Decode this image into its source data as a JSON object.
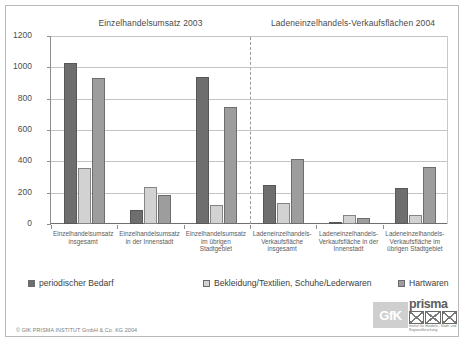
{
  "chart_data": {
    "type": "bar",
    "title": "",
    "panels": [
      {
        "name": "Einzelhandelsumsatz 2003"
      },
      {
        "name": "Ladeneinzelhandels-Verkaufsflächen 2004"
      }
    ],
    "categories": [
      "Einzelhandelsumsatz insgesamt",
      "Einzelhandelsumsatz in der Innenstadt",
      "Einzelhandelsumsatz im übrigen Stadtgebiet",
      "Ladeneinzelhandels-Verkaufsfläche insgesamt",
      "Ladeneinzelhandels-Verkaufsfläche in der Innenstadt",
      "Ladeneinzelhandels-Verkaufsfläche im übrigen Stadtgebiet"
    ],
    "series": [
      {
        "name": "periodischer Bedarf",
        "color": "#6e6e6e",
        "values": [
          1030,
          90,
          940,
          250,
          10,
          230
        ]
      },
      {
        "name": "Bekleidung/Textilien, Schuhe/Lederwaren",
        "color": "#d2d2d2",
        "values": [
          360,
          235,
          120,
          135,
          60,
          55
        ]
      },
      {
        "name": "Hartwaren",
        "color": "#9d9d9d",
        "values": [
          935,
          185,
          745,
          415,
          40,
          365
        ]
      }
    ],
    "ylim": [
      0,
      1200
    ],
    "yticks": [
      0,
      200,
      400,
      600,
      800,
      1000,
      1200
    ],
    "xlabel": "",
    "ylabel": "",
    "grid": true,
    "legend_position": "bottom",
    "divider_after_category_index": 2
  },
  "titles": {
    "left": "Einzelhandelsumsatz 2003",
    "right": "Ladeneinzelhandels-Verkaufsflächen 2004"
  },
  "legend": {
    "items": [
      {
        "label": "periodischer Bedarf",
        "color": "#6e6e6e"
      },
      {
        "label": "Bekleidung/Textilien, Schuhe/Lederwaren",
        "color": "#d2d2d2"
      },
      {
        "label": "Hartwaren",
        "color": "#9d9d9d"
      }
    ]
  },
  "footer": {
    "copyright": "© GfK PRISMA INSTITUT GmbH & Co. KG 2004"
  },
  "logo": {
    "gfk": "GfK",
    "prisma": "prisma",
    "tagline": "Institut für Handels-, Stadt- und Regionalforschung"
  }
}
